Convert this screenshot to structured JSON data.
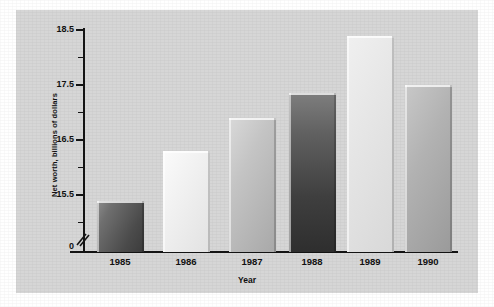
{
  "chart_data": {
    "type": "bar",
    "title": "",
    "xlabel": "Year",
    "ylabel": "Net worth, billions of dollars",
    "categories": [
      "1985",
      "1986",
      "1987",
      "1988",
      "1989",
      "1990"
    ],
    "values": [
      15.4,
      16.3,
      16.9,
      17.35,
      18.4,
      17.5
    ],
    "ytick_labels": [
      "0",
      "15.5",
      "16.5",
      "17.5",
      "18.5"
    ],
    "ytick_values": [
      0,
      15.5,
      16.5,
      17.5,
      18.5
    ],
    "ylim": [
      15.0,
      18.8
    ],
    "axis_break": true,
    "grid": false,
    "legend": null,
    "bar_colors": [
      "#595959",
      "#ededed",
      "#b9b9b9",
      "#4a4a4a",
      "#e4e4e4",
      "#a8a8a8"
    ],
    "panel_color": "#d6d6d6",
    "axis_color": "#141414",
    "minor_ticks_per_interval": 1
  },
  "axis": {
    "y_title": "Net worth, billions of dollars",
    "x_title": "Year"
  }
}
